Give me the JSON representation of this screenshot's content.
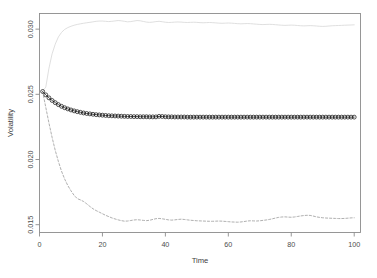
{
  "chart_data": {
    "type": "line",
    "title": "",
    "xlabel": "Time",
    "ylabel": "Volatility",
    "xlim": [
      0,
      102
    ],
    "ylim": [
      0.0144,
      0.0312
    ],
    "xticks": [
      0,
      20,
      40,
      60,
      80,
      100
    ],
    "xticklabels": [
      "0",
      "20",
      "40",
      "60",
      "80",
      "100"
    ],
    "yticks": [
      0.015,
      0.02,
      0.025,
      0.03
    ],
    "yticklabels": [
      "0.015",
      "0.020",
      "0.025",
      "0.030"
    ],
    "grid": false,
    "legend": "none",
    "box": true,
    "colors": {
      "upper": "#d9d9d9",
      "middle": "#1a1a1a",
      "lower": "#9a9a9a",
      "axis": "#808080",
      "text": "#4d4d4d"
    },
    "series": [
      {
        "name": "upper-band",
        "style": "solid",
        "marker": "none",
        "color": "#d9d9d9",
        "x": [
          1,
          2,
          3,
          4,
          5,
          6,
          7,
          8,
          9,
          10,
          11,
          12,
          13,
          14,
          15,
          16,
          17,
          18,
          19,
          20,
          21,
          22,
          23,
          24,
          25,
          26,
          27,
          28,
          29,
          30,
          31,
          32,
          33,
          34,
          35,
          36,
          37,
          38,
          39,
          40,
          41,
          42,
          43,
          44,
          45,
          46,
          47,
          48,
          49,
          50,
          51,
          52,
          53,
          54,
          55,
          56,
          57,
          58,
          59,
          60,
          61,
          62,
          63,
          64,
          65,
          66,
          67,
          68,
          69,
          70,
          71,
          72,
          73,
          74,
          75,
          76,
          77,
          78,
          79,
          80,
          81,
          82,
          83,
          84,
          85,
          86,
          87,
          88,
          89,
          90,
          91,
          92,
          93,
          94,
          95,
          96,
          97,
          98,
          99,
          100
        ],
        "values": [
          0.02525,
          0.02555,
          0.027,
          0.0281,
          0.02885,
          0.0294,
          0.02975,
          0.02998,
          0.03012,
          0.03022,
          0.0303,
          0.03036,
          0.03041,
          0.03045,
          0.03049,
          0.03052,
          0.03056,
          0.0306,
          0.03062,
          0.03062,
          0.0306,
          0.03058,
          0.0306,
          0.03063,
          0.03066,
          0.03064,
          0.0306,
          0.03056,
          0.03058,
          0.03062,
          0.03066,
          0.03064,
          0.03059,
          0.03054,
          0.03052,
          0.03054,
          0.03058,
          0.0306,
          0.03057,
          0.03053,
          0.03051,
          0.03052,
          0.03054,
          0.03055,
          0.03054,
          0.03052,
          0.03051,
          0.03052,
          0.03053,
          0.03052,
          0.0305,
          0.03049,
          0.0305,
          0.03051,
          0.0305,
          0.03048,
          0.03046,
          0.03045,
          0.03046,
          0.03047,
          0.03046,
          0.03044,
          0.03042,
          0.03041,
          0.03042,
          0.03043,
          0.03042,
          0.0304,
          0.03038,
          0.03036,
          0.03035,
          0.03036,
          0.03037,
          0.03036,
          0.03034,
          0.03032,
          0.0303,
          0.03029,
          0.0303,
          0.03031,
          0.0303,
          0.03028,
          0.03026,
          0.03025,
          0.03026,
          0.03027,
          0.03026,
          0.03024,
          0.03022,
          0.03021,
          0.03022,
          0.03024,
          0.03026,
          0.03027,
          0.03028,
          0.03029,
          0.0303,
          0.03031,
          0.03032,
          0.03033
        ]
      },
      {
        "name": "fitted-volatility",
        "style": "solid",
        "marker": "circle",
        "color": "#1a1a1a",
        "x": [
          1,
          2,
          3,
          4,
          5,
          6,
          7,
          8,
          9,
          10,
          11,
          12,
          13,
          14,
          15,
          16,
          17,
          18,
          19,
          20,
          21,
          22,
          23,
          24,
          25,
          26,
          27,
          28,
          29,
          30,
          31,
          32,
          33,
          34,
          35,
          36,
          37,
          38,
          39,
          40,
          41,
          42,
          43,
          44,
          45,
          46,
          47,
          48,
          49,
          50,
          51,
          52,
          53,
          54,
          55,
          56,
          57,
          58,
          59,
          60,
          61,
          62,
          63,
          64,
          65,
          66,
          67,
          68,
          69,
          70,
          71,
          72,
          73,
          74,
          75,
          76,
          77,
          78,
          79,
          80,
          81,
          82,
          83,
          84,
          85,
          86,
          87,
          88,
          89,
          90,
          91,
          92,
          93,
          94,
          95,
          96,
          97,
          98,
          99,
          100
        ],
        "values": [
          0.02522,
          0.02496,
          0.02473,
          0.02453,
          0.02436,
          0.02421,
          0.02408,
          0.02397,
          0.02388,
          0.0238,
          0.02373,
          0.02367,
          0.02362,
          0.02357,
          0.02353,
          0.0235,
          0.02347,
          0.02344,
          0.02342,
          0.0234,
          0.02338,
          0.02336,
          0.02335,
          0.02334,
          0.02333,
          0.02332,
          0.02331,
          0.0233,
          0.0233,
          0.02329,
          0.02329,
          0.02328,
          0.02328,
          0.02328,
          0.02327,
          0.02327,
          0.02327,
          0.02331,
          0.0233,
          0.02328,
          0.02327,
          0.02327,
          0.02326,
          0.02326,
          0.02326,
          0.02326,
          0.02325,
          0.02325,
          0.02325,
          0.02325,
          0.02325,
          0.02325,
          0.02325,
          0.02325,
          0.02325,
          0.02325,
          0.02325,
          0.02325,
          0.02325,
          0.02325,
          0.02325,
          0.02325,
          0.02325,
          0.02325,
          0.02325,
          0.02325,
          0.02325,
          0.02325,
          0.02325,
          0.02325,
          0.02325,
          0.02325,
          0.02325,
          0.02325,
          0.02325,
          0.02325,
          0.02325,
          0.02325,
          0.02325,
          0.02325,
          0.02325,
          0.02325,
          0.02325,
          0.02325,
          0.02325,
          0.02325,
          0.02325,
          0.02325,
          0.02325,
          0.02325,
          0.02325,
          0.02325,
          0.02325,
          0.02325,
          0.02325,
          0.02325,
          0.02325,
          0.02325,
          0.02325,
          0.02325
        ]
      },
      {
        "name": "lower-band",
        "style": "dashed",
        "marker": "none",
        "color": "#9a9a9a",
        "x": [
          1,
          2,
          3,
          4,
          5,
          6,
          7,
          8,
          9,
          10,
          11,
          12,
          13,
          14,
          15,
          16,
          17,
          18,
          19,
          20,
          21,
          22,
          23,
          24,
          25,
          26,
          27,
          28,
          29,
          30,
          31,
          32,
          33,
          34,
          35,
          36,
          37,
          38,
          39,
          40,
          41,
          42,
          43,
          44,
          45,
          46,
          47,
          48,
          49,
          50,
          51,
          52,
          53,
          54,
          55,
          56,
          57,
          58,
          59,
          60,
          61,
          62,
          63,
          64,
          65,
          66,
          67,
          68,
          69,
          70,
          71,
          72,
          73,
          74,
          75,
          76,
          77,
          78,
          79,
          80,
          81,
          82,
          83,
          84,
          85,
          86,
          87,
          88,
          89,
          90,
          91,
          92,
          93,
          94,
          95,
          96,
          97,
          98,
          99,
          100
        ],
        "values": [
          0.0252,
          0.024,
          0.0228,
          0.0217,
          0.0207,
          0.01985,
          0.0191,
          0.0185,
          0.018,
          0.0176,
          0.01725,
          0.017,
          0.0169,
          0.01678,
          0.0166,
          0.0164,
          0.01622,
          0.01608,
          0.01596,
          0.01584,
          0.01572,
          0.01562,
          0.01552,
          0.01544,
          0.01537,
          0.01531,
          0.01527,
          0.01528,
          0.01532,
          0.01536,
          0.01538,
          0.01536,
          0.01533,
          0.01531,
          0.01534,
          0.0154,
          0.01546,
          0.01548,
          0.01545,
          0.01541,
          0.01537,
          0.01535,
          0.01537,
          0.0154,
          0.01542,
          0.0154,
          0.01537,
          0.01534,
          0.01532,
          0.0153,
          0.01529,
          0.01528,
          0.01527,
          0.01526,
          0.01526,
          0.01527,
          0.01528,
          0.01527,
          0.01525,
          0.01523,
          0.01521,
          0.0152,
          0.01519,
          0.01521,
          0.01524,
          0.01528,
          0.0153,
          0.01529,
          0.01528,
          0.0153,
          0.01533,
          0.01536,
          0.0154,
          0.01545,
          0.01551,
          0.01556,
          0.01559,
          0.0156,
          0.01558,
          0.01557,
          0.01559,
          0.01563,
          0.01567,
          0.0157,
          0.01572,
          0.01571,
          0.01566,
          0.0156,
          0.01556,
          0.01553,
          0.01551,
          0.0155,
          0.01549,
          0.01548,
          0.01547,
          0.01547,
          0.01548,
          0.0155,
          0.01552,
          0.01553
        ]
      }
    ]
  }
}
